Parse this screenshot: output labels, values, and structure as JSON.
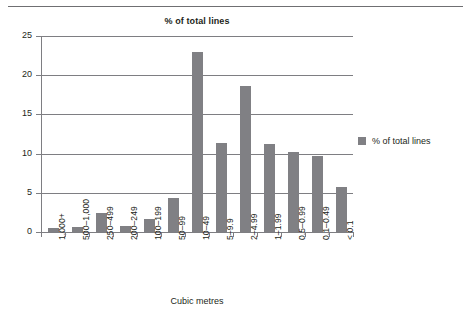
{
  "chart_data": {
    "type": "bar",
    "title": "% of total lines",
    "xlabel": "Cubic metres",
    "ylabel": "",
    "ylim": [
      0,
      25
    ],
    "yticks": [
      0,
      5,
      10,
      15,
      20,
      25
    ],
    "grid": true,
    "legend_position": "right",
    "legend": [
      "% of total lines"
    ],
    "categories": [
      "1,000+",
      "500–1,000",
      "250–499",
      "200–249",
      "100–199",
      "50–99",
      "10–49",
      "5–9.9",
      "2–4.99",
      "1–1.99",
      "0.5–0.99",
      "0.1–0.49",
      "< 0.1"
    ],
    "series": [
      {
        "name": "% of total lines",
        "color": "#808084",
        "values": [
          0.5,
          0.6,
          2.4,
          0.8,
          1.7,
          4.4,
          23.0,
          11.3,
          18.6,
          11.2,
          10.2,
          9.7,
          5.7
        ]
      }
    ]
  },
  "colors": {
    "bar": "#808084",
    "axis": "#7e7e82",
    "text": "#231f20",
    "background": "#ffffff"
  }
}
